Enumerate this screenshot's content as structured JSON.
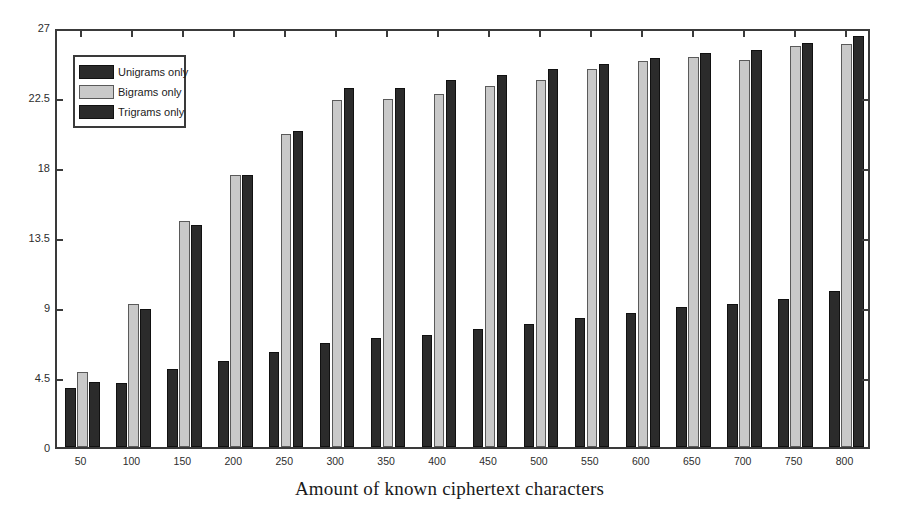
{
  "chart_data": {
    "type": "bar",
    "title": "",
    "xlabel": "Amount of known ciphertext characters",
    "ylabel": "",
    "categories": [
      "50",
      "100",
      "150",
      "200",
      "250",
      "300",
      "350",
      "400",
      "450",
      "500",
      "550",
      "600",
      "650",
      "700",
      "750",
      "800"
    ],
    "series": [
      {
        "name": "Unigrams only",
        "color": "#2b2b2b",
        "values": [
          3.8,
          4.1,
          5.0,
          5.5,
          6.1,
          6.7,
          7.0,
          7.2,
          7.6,
          7.9,
          8.3,
          8.6,
          9.0,
          9.2,
          9.5,
          10.0
        ]
      },
      {
        "name": "Bigrams only",
        "color": "#c9c9c9",
        "values": [
          4.8,
          9.2,
          14.5,
          17.5,
          20.1,
          22.3,
          22.4,
          22.7,
          23.2,
          23.6,
          24.3,
          24.8,
          25.1,
          24.9,
          25.8,
          25.9
        ]
      },
      {
        "name": "Trigrams only",
        "color": "#2b2b2b",
        "values": [
          4.2,
          8.9,
          14.3,
          17.5,
          20.3,
          23.1,
          23.1,
          23.6,
          23.9,
          24.3,
          24.6,
          25.0,
          25.3,
          25.5,
          26.0,
          26.4
        ]
      }
    ],
    "ylim": [
      0,
      27
    ],
    "yticks": [
      "0",
      "4.5",
      "9",
      "13.5",
      "18",
      "22.5",
      "27"
    ],
    "ytick_values": [
      0,
      4.5,
      9,
      13.5,
      18,
      22.5,
      27
    ],
    "grid": false,
    "legend_position": "upper-left"
  },
  "legend": {
    "items": [
      {
        "label": "Unigrams only",
        "swatch": "uni"
      },
      {
        "label": "Bigrams only",
        "swatch": "bi"
      },
      {
        "label": "Trigrams only",
        "swatch": "tri"
      }
    ]
  },
  "axes": {
    "x_title": "Amount of known ciphertext characters"
  }
}
